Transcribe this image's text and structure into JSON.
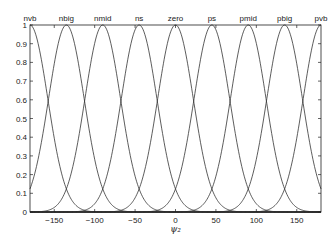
{
  "chart_data": {
    "type": "line",
    "title": "",
    "xlabel": "ψ₂",
    "ylabel": "",
    "xlim": [
      -180,
      180
    ],
    "ylim": [
      0,
      1
    ],
    "grid": false,
    "xticks": [
      -150,
      -100,
      -50,
      0,
      50,
      100,
      150
    ],
    "yticks": [
      0,
      0.1,
      0.2,
      0.3,
      0.4,
      0.5,
      0.6,
      0.7,
      0.8,
      0.9,
      1
    ],
    "ytick_labels": [
      "0",
      "0.1",
      "0.2",
      "0.3",
      "0.4",
      "0.5",
      "0.6",
      "0.7",
      "0.8",
      "0.9",
      "1"
    ],
    "xtick_labels": [
      "−150",
      "−100",
      "−50",
      "0",
      "50",
      "100",
      "150"
    ],
    "series": [
      {
        "name": "nvb",
        "center": -180,
        "sigma": 22
      },
      {
        "name": "nbig",
        "center": -135,
        "sigma": 22
      },
      {
        "name": "nmid",
        "center": -90,
        "sigma": 22
      },
      {
        "name": "ns",
        "center": -45,
        "sigma": 22
      },
      {
        "name": "zero",
        "center": 0,
        "sigma": 22
      },
      {
        "name": "ps",
        "center": 45,
        "sigma": 22
      },
      {
        "name": "pmid",
        "center": 90,
        "sigma": 22
      },
      {
        "name": "pbig",
        "center": 135,
        "sigma": 22
      },
      {
        "name": "pvb",
        "center": 180,
        "sigma": 22
      }
    ],
    "line_color": "#333333"
  }
}
